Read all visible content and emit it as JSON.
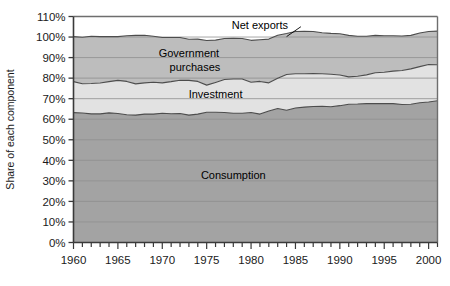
{
  "chart_data": {
    "type": "area",
    "stacked": true,
    "title": "",
    "xlabel": "",
    "ylabel": "Share of each component",
    "ylim": [
      0,
      110
    ],
    "xlim": [
      1960,
      2001
    ],
    "grid": true,
    "legend_position": "inline-annotations",
    "ytick_labels": [
      "0%",
      "10%",
      "20%",
      "30%",
      "40%",
      "50%",
      "60%",
      "70%",
      "80%",
      "90%",
      "100%",
      "110%"
    ],
    "ytick_values": [
      0,
      10,
      20,
      30,
      40,
      50,
      60,
      70,
      80,
      90,
      100,
      110
    ],
    "xtick_labels": [
      "1960",
      "1965",
      "1970",
      "1975",
      "1980",
      "1985",
      "1990",
      "1995",
      "2000"
    ],
    "xtick_values": [
      1960,
      1965,
      1970,
      1975,
      1980,
      1985,
      1990,
      1995,
      2000
    ],
    "x": [
      1960,
      1961,
      1962,
      1963,
      1964,
      1965,
      1966,
      1967,
      1968,
      1969,
      1970,
      1971,
      1972,
      1973,
      1974,
      1975,
      1976,
      1977,
      1978,
      1979,
      1980,
      1981,
      1982,
      1983,
      1984,
      1985,
      1986,
      1987,
      1988,
      1989,
      1990,
      1991,
      1992,
      1993,
      1994,
      1995,
      1996,
      1997,
      1998,
      1999,
      2000,
      2001
    ],
    "series": [
      {
        "name": "Consumption",
        "color": "#a3a3a3",
        "label_x": 1978,
        "label_y": 33,
        "values": [
          63.2,
          63.0,
          62.6,
          62.6,
          63.1,
          62.8,
          62.2,
          62.0,
          62.5,
          62.5,
          62.9,
          62.7,
          62.8,
          62.0,
          62.5,
          63.4,
          63.4,
          63.3,
          62.9,
          62.9,
          63.3,
          62.5,
          64.0,
          65.2,
          64.4,
          65.5,
          65.9,
          66.2,
          66.3,
          66.1,
          66.6,
          67.3,
          67.4,
          67.6,
          67.6,
          67.6,
          67.6,
          67.2,
          67.3,
          68.0,
          68.4,
          69.0
        ]
      },
      {
        "name": "Investment",
        "color": "#e2e2e2",
        "label_x": 1976,
        "label_y": 72.5,
        "values": [
          15.1,
          14.3,
          14.8,
          15.0,
          15.2,
          16.1,
          16.2,
          15.2,
          15.2,
          15.5,
          14.8,
          15.6,
          16.2,
          16.9,
          15.9,
          13.2,
          14.5,
          16.0,
          16.7,
          16.7,
          14.7,
          15.9,
          13.7,
          14.7,
          17.4,
          16.6,
          16.2,
          16.0,
          15.8,
          15.8,
          14.9,
          13.3,
          13.5,
          14.0,
          15.0,
          15.3,
          15.8,
          16.5,
          17.2,
          17.6,
          18.2,
          17.5
        ]
      },
      {
        "name": "Government purchases",
        "color": "#bdbdbd",
        "label_x": 1973,
        "label_y": 92,
        "values": [
          21.9,
          22.6,
          23.0,
          22.6,
          21.9,
          21.3,
          22.2,
          23.6,
          23.2,
          22.4,
          22.1,
          21.5,
          20.8,
          20.0,
          20.6,
          21.7,
          20.6,
          20.0,
          19.8,
          19.7,
          20.4,
          20.3,
          21.3,
          21.0,
          19.9,
          20.6,
          20.7,
          20.5,
          20.0,
          19.9,
          20.1,
          20.2,
          19.5,
          18.8,
          18.2,
          17.7,
          17.2,
          16.8,
          16.3,
          16.4,
          16.1,
          16.4
        ]
      },
      {
        "name": "Net exports",
        "color": "#ffffff",
        "label_x": 1981,
        "label_y": 106,
        "values": [
          0.5,
          0.6,
          0.4,
          0.5,
          0.8,
          0.4,
          0.0,
          -0.1,
          -0.3,
          -0.2,
          0.1,
          -0.2,
          -0.5,
          0.6,
          0.3,
          1.1,
          0.2,
          -0.8,
          -0.8,
          -0.3,
          0.1,
          -0.1,
          -0.2,
          -1.0,
          -2.4,
          -2.8,
          -3.1,
          -3.1,
          -2.0,
          -1.5,
          -1.3,
          -0.5,
          -0.6,
          -1.2,
          -1.5,
          -1.4,
          -1.3,
          -1.3,
          -2.2,
          -3.0,
          -3.9,
          -3.6
        ]
      }
    ],
    "boundaries_note": "Bands stack bottom-up: Consumption, Investment, Government purchases, Net exports."
  },
  "annotations": {
    "net_exports_leader": "leader-line from Net exports label down-right to the 100% boundary curve"
  }
}
